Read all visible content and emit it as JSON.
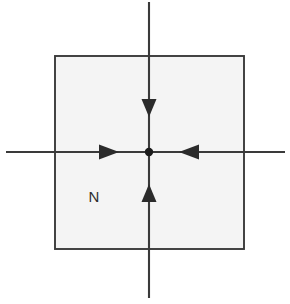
{
  "figure": {
    "kind": "phase-portrait-diagram",
    "caption_label": "N",
    "background_color": "#ffffff"
  },
  "region": {
    "label": "N",
    "shape": "square",
    "fill_color": "#f4f4f4",
    "stroke_color": "#3a3a3a",
    "x": 55,
    "y": 56,
    "width": 189,
    "height": 193,
    "label_x": 94,
    "label_y": 202
  },
  "axes": {
    "stroke_color": "#3a3a3a",
    "horizontal": {
      "name": "horizontal-axis",
      "x1": 6,
      "y1": 152,
      "x2": 285,
      "y2": 152
    },
    "vertical": {
      "name": "vertical-axis",
      "x1": 149,
      "y1": 2,
      "x2": 149,
      "y2": 298
    }
  },
  "origin": {
    "label": "origin-point",
    "x": 149,
    "y": 152,
    "radius": 4.2,
    "color": "#1c1c1c"
  },
  "arrows": [
    {
      "name": "arrow-down-top",
      "direction": "down",
      "points": "141.5,99 156.5,99 149,117",
      "color": "#2b2b2b"
    },
    {
      "name": "arrow-up-bottom",
      "direction": "up",
      "points": "141.5,202 156.5,202 149,184",
      "color": "#2b2b2b"
    },
    {
      "name": "arrow-right-left-side",
      "direction": "right",
      "points": "99,144.5 99,159.5 119,152",
      "color": "#2b2b2b"
    },
    {
      "name": "arrow-left-right-side",
      "direction": "left",
      "points": "199,144.5 199,159.5 179,152",
      "color": "#2b2b2b"
    }
  ]
}
